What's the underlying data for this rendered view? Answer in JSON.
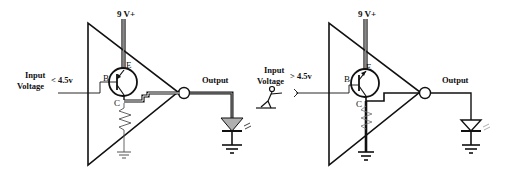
{
  "diagram": {
    "stroke_color": "#111111",
    "led_fill_off": "#b0b0b0",
    "led_fill_on": "#ffffff",
    "circuits": [
      {
        "id": "left",
        "supply_label": "9 V+",
        "input_label_line1": "Input",
        "input_label_line2": "Voltage",
        "condition": "< 4.5v",
        "base_label": "B",
        "emitter_label": "E",
        "collector_label": "C",
        "output_label": "Output",
        "led_state": "on"
      },
      {
        "id": "right",
        "supply_label": "9 V+",
        "input_label_line1": "Input",
        "input_label_line2": "Voltage",
        "condition": "> 4.5v",
        "base_label": "B",
        "emitter_label": "E",
        "collector_label": "C",
        "output_label": "Output",
        "led_state": "off",
        "extra": "stick-figure pushing input"
      }
    ]
  }
}
